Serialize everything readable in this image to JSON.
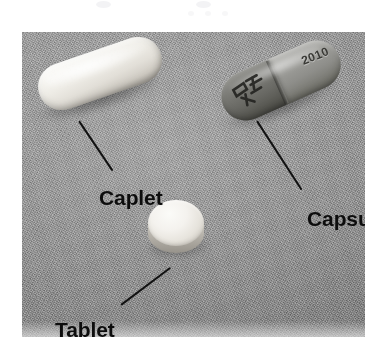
{
  "figure": {
    "kind": "photograph",
    "background_color": "#9d9d9d",
    "label_color": "#0d0d0d",
    "leader_line_color": "#121212"
  },
  "objects": [
    {
      "id": "caplet",
      "label": "Caplet",
      "shape": "oblong capsule-shaped tablet",
      "color": "white",
      "imprint": ""
    },
    {
      "id": "capsule",
      "label": "Capsule",
      "shape": "two-piece gelatin capsule",
      "color": "two-tone gray",
      "imprint": "2010"
    },
    {
      "id": "tablet",
      "label": "Tablet",
      "shape": "round flat disc",
      "color": "white",
      "imprint": ""
    }
  ],
  "labels": {
    "caplet": "Caplet",
    "capsule": "Capsule",
    "tablet": "Tablet"
  },
  "imprints": {
    "capsule_number": "2010"
  }
}
